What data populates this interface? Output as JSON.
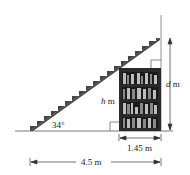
{
  "diagram": {
    "angle_label": "34°",
    "h_label_var": "h",
    "h_label_unit": " m",
    "d_label_var": "d",
    "d_label_unit": " m",
    "shelf_width_label": "1.45 m",
    "total_width_label": "4.5 m"
  },
  "colors": {
    "line": "#555555",
    "stairs": "#444444",
    "bookshelf": "#2a2a2a",
    "books_light": "#bdbdbd",
    "books_mid": "#8a8a8a"
  }
}
